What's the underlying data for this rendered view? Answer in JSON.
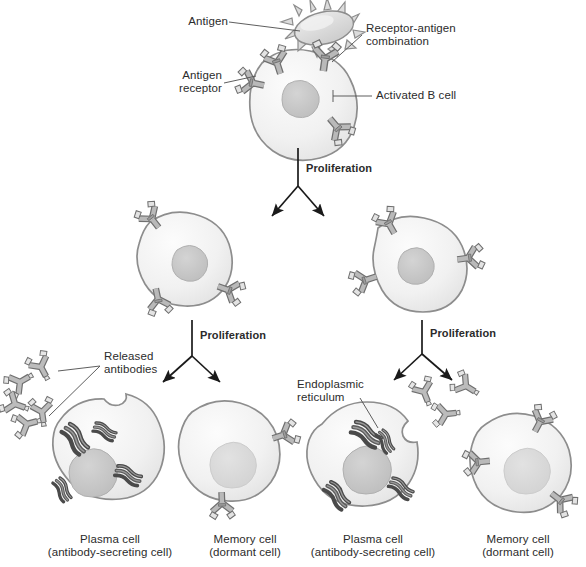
{
  "figure": {
    "background_color": "#ffffff",
    "palette": {
      "cell_fill": "#f2f2f2",
      "cell_fill_light": "#fafafa",
      "cell_edge": "#8d8d8d",
      "nucleus_fill": "#c9c9c9",
      "nucleus_edge": "#a8a8a8",
      "receptor_fill": "#b8b8b8",
      "receptor_edge": "#6f6f6f",
      "receptor_tip": "#e0e0e0",
      "er_fill": "#7f7f7f",
      "er_edge": "#4a4a4a",
      "antigen_fill": "#dcdcdc",
      "antigen_edge": "#8d8d8d",
      "arrow_color": "#1a1a1a",
      "leader_color": "#555555",
      "text_color": "#2b2b2b"
    }
  },
  "callouts": {
    "antigen": "Antigen",
    "receptor_antigen_combination_line1": "Receptor-antigen",
    "receptor_antigen_combination_line2": "combination",
    "antigen_receptor_line1": "Antigen",
    "antigen_receptor_line2": "receptor",
    "activated_b_cell": "Activated B cell",
    "released_antibodies_line1": "Released",
    "released_antibodies_line2": "antibodies",
    "endoplasmic_reticulum_line1": "Endoplasmic",
    "endoplasmic_reticulum_line2": "reticulum"
  },
  "process_labels": {
    "proliferation_top": "Proliferation",
    "proliferation_left": "Proliferation",
    "proliferation_right": "Proliferation"
  },
  "cell_captions": [
    {
      "id": "plasma-cell-left",
      "line1": "Plasma cell",
      "line2": "(antibody-secreting cell)"
    },
    {
      "id": "memory-cell-left",
      "line1": "Memory cell",
      "line2": "(dormant cell)"
    },
    {
      "id": "plasma-cell-right",
      "line1": "Plasma cell",
      "line2": "(antibody-secreting cell)"
    },
    {
      "id": "memory-cell-right",
      "line1": "Memory cell",
      "line2": "(dormant cell)"
    }
  ],
  "diagram_structure": {
    "levels": [
      {
        "level": 1,
        "cells": [
          {
            "name": "activated-b-cell",
            "type": "activated B cell",
            "receptors": 4,
            "has_nucleus": true,
            "has_antigen_bound": true
          }
        ]
      },
      {
        "level": 2,
        "cells": [
          {
            "name": "daughter-b-cell-left",
            "type": "B cell",
            "receptors": 3,
            "has_nucleus": true
          },
          {
            "name": "daughter-b-cell-right",
            "type": "B cell",
            "receptors": 3,
            "has_nucleus": true
          }
        ]
      },
      {
        "level": 3,
        "cells": [
          {
            "name": "plasma-cell-left",
            "type": "plasma cell",
            "receptors": 0,
            "has_nucleus": true,
            "er_clusters": 4,
            "secretes_antibodies": true
          },
          {
            "name": "memory-cell-left",
            "type": "memory cell",
            "receptors": 2,
            "has_nucleus": true,
            "er_clusters": 0
          },
          {
            "name": "plasma-cell-right",
            "type": "plasma cell",
            "receptors": 0,
            "has_nucleus": true,
            "er_clusters": 4,
            "secretes_antibodies": true
          },
          {
            "name": "memory-cell-right",
            "type": "memory cell",
            "receptors": 3,
            "has_nucleus": true,
            "er_clusters": 0
          }
        ]
      }
    ],
    "branch_points": 3,
    "free_antibody_count_left": 5,
    "free_antibody_count_right": 3
  }
}
